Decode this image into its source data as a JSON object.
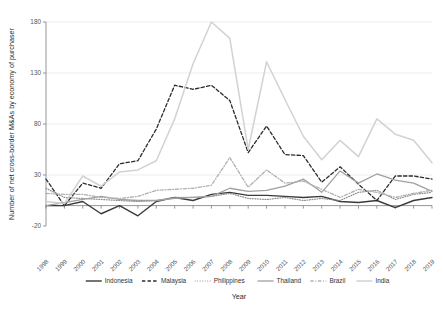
{
  "chart_data": {
    "type": "line",
    "title": "",
    "xlabel": "Year",
    "ylabel": "Number of net cross-border M&As by economy of purchaser",
    "x": [
      1998,
      1999,
      2000,
      2001,
      2002,
      2003,
      2004,
      2005,
      2006,
      2007,
      2008,
      2009,
      2010,
      2011,
      2012,
      2013,
      2014,
      2015,
      2016,
      2017,
      2018,
      2019
    ],
    "xtick_labels": [
      "1998",
      "1999",
      "2000",
      "2001",
      "2002",
      "2003",
      "2004",
      "2005",
      "2006",
      "2007",
      "2008",
      "2009",
      "2010",
      "2011",
      "2012",
      "2013",
      "2014",
      "2015",
      "2016",
      "2017",
      "2018",
      "2019"
    ],
    "ytick_labels": [
      "-20",
      "30",
      "80",
      "130",
      "180"
    ],
    "ytick_values": [
      -20,
      30,
      80,
      130,
      180
    ],
    "ylim": [
      -20,
      180
    ],
    "xlim": [
      1998,
      2019
    ],
    "grid": "horizontal",
    "legend_position": "bottom",
    "series": [
      {
        "name": "Indonesia",
        "style": "solid",
        "color": "#3a3a3a",
        "width": 1.4,
        "values": [
          0,
          0,
          4,
          -8,
          0,
          -10,
          4,
          8,
          5,
          11,
          13,
          10,
          10,
          9,
          8,
          9,
          4,
          3,
          5,
          -2,
          5,
          8
        ]
      },
      {
        "name": "Malaysia",
        "style": "dashed",
        "color": "#2b2b2b",
        "width": 1.3,
        "values": [
          26,
          0,
          22,
          17,
          41,
          44,
          75,
          118,
          114,
          118,
          103,
          52,
          78,
          50,
          49,
          23,
          38,
          21,
          5,
          29,
          29,
          26
        ]
      },
      {
        "name": "Philippines",
        "style": "dotted",
        "color": "#8c8c8c",
        "width": 1.2,
        "values": [
          17,
          8,
          7,
          6,
          5,
          4,
          5,
          8,
          8,
          9,
          12,
          7,
          6,
          8,
          5,
          7,
          5,
          13,
          15,
          6,
          11,
          13
        ]
      },
      {
        "name": "Thailand",
        "style": "solid",
        "color": "#a0a0a0",
        "width": 1.3,
        "values": [
          0,
          3,
          6,
          9,
          6,
          5,
          5,
          7,
          8,
          9,
          17,
          14,
          15,
          19,
          26,
          13,
          34,
          22,
          31,
          25,
          22,
          14
        ]
      },
      {
        "name": "Brazil",
        "style": "dashdot",
        "color": "#b0b0b0",
        "width": 1.3,
        "values": [
          12,
          11,
          11,
          8,
          7,
          9,
          15,
          16,
          17,
          20,
          47,
          18,
          35,
          22,
          24,
          16,
          8,
          16,
          13,
          8,
          12,
          15
        ]
      },
      {
        "name": "India",
        "style": "solid",
        "color": "#d2d2d2",
        "width": 1.5,
        "values": [
          4,
          2,
          29,
          19,
          33,
          35,
          44,
          85,
          139,
          180,
          164,
          55,
          141,
          104,
          68,
          45,
          64,
          48,
          85,
          70,
          64,
          42
        ]
      }
    ]
  },
  "legend": {
    "items": [
      {
        "label": "Indonesia"
      },
      {
        "label": "Malaysia"
      },
      {
        "label": "Philippines"
      },
      {
        "label": "Thailand"
      },
      {
        "label": "Brazil"
      },
      {
        "label": "India"
      }
    ]
  }
}
